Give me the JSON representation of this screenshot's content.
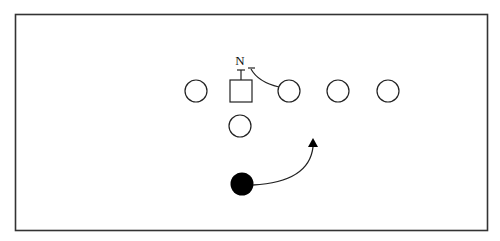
{
  "diagram": {
    "type": "football-play-diagram",
    "frame": {
      "x": 15,
      "y": 14,
      "width": 472,
      "height": 216,
      "stroke": "#333333"
    },
    "colors": {
      "stroke": "#222222",
      "fill_player": "#ffffff",
      "fill_highlight": "#000000"
    },
    "labels": {
      "nose": "N"
    },
    "offense_line": [
      {
        "id": "player-1",
        "shape": "circle",
        "cx": 196,
        "cy": 91,
        "r": 11
      },
      {
        "id": "center",
        "shape": "square",
        "x": 230,
        "y": 80,
        "size": 22
      },
      {
        "id": "player-3",
        "shape": "circle",
        "cx": 289,
        "cy": 91,
        "r": 11
      },
      {
        "id": "player-4",
        "shape": "circle",
        "cx": 338,
        "cy": 91,
        "r": 11
      },
      {
        "id": "player-5",
        "shape": "circle",
        "cx": 388,
        "cy": 91,
        "r": 11
      }
    ],
    "backfield": [
      {
        "id": "player-back",
        "shape": "circle",
        "cx": 240,
        "cy": 126,
        "r": 11
      }
    ],
    "highlighted_player": {
      "id": "ball-carrier",
      "shape": "filled-circle",
      "cx": 242,
      "cy": 184,
      "r": 11
    },
    "routes": [
      {
        "id": "center-block",
        "type": "block-marker"
      },
      {
        "id": "guard-block-curve",
        "type": "curved-block"
      },
      {
        "id": "carrier-route",
        "type": "curved-arrow"
      }
    ]
  }
}
